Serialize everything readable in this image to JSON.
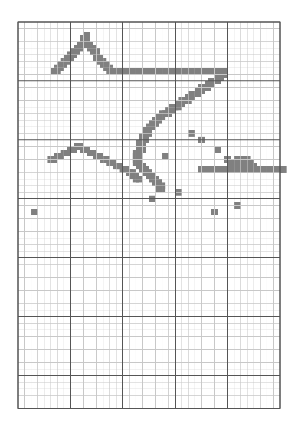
{
  "document": {
    "title": "Cross-Stitch Pattern Chart",
    "type": "pixel-grid-pattern",
    "subject": "Shooting stars and star"
  },
  "colors": {
    "background": "#ffffff",
    "fill": "#808080",
    "grid_minor": "#c8c8c8",
    "grid_major": "#555555",
    "grid_border": "#555555"
  },
  "grid": {
    "columns": 40,
    "rows": 59,
    "cell_size_px": 6.55,
    "origin_x_px": 18,
    "origin_y_px": 22,
    "major_every_columns": 8,
    "major_every_rows": 9,
    "minor_line_width_px": 0.5,
    "major_line_width_px": 1
  },
  "chart_data": {
    "type": "heatmap",
    "xlabel": "",
    "ylabel": "",
    "grid_on": true,
    "legend_position": "none",
    "categories": [],
    "values": [],
    "legend": [
      {
        "symbol": "filled-cell",
        "color": "#808080",
        "label": "Stitch"
      },
      {
        "symbol": "empty-cell",
        "color": "#ffffff",
        "label": "No stitch"
      }
    ],
    "stitch_cells": [
      [
        20,
        3
      ],
      [
        19,
        4
      ],
      [
        20,
        4
      ],
      [
        19,
        5
      ],
      [
        20,
        5
      ],
      [
        18,
        6
      ],
      [
        19,
        6
      ],
      [
        21,
        6
      ],
      [
        17,
        7
      ],
      [
        18,
        7
      ],
      [
        21,
        7
      ],
      [
        22,
        7
      ],
      [
        16,
        8
      ],
      [
        17,
        8
      ],
      [
        22,
        8
      ],
      [
        23,
        8
      ],
      [
        15,
        9
      ],
      [
        16,
        9
      ],
      [
        23,
        9
      ],
      [
        14,
        10
      ],
      [
        15,
        10
      ],
      [
        23,
        10
      ],
      [
        24,
        10
      ],
      [
        13,
        11
      ],
      [
        14,
        11
      ],
      [
        24,
        11
      ],
      [
        25,
        11
      ],
      [
        12,
        12
      ],
      [
        13,
        12
      ],
      [
        25,
        12
      ],
      [
        26,
        12
      ],
      [
        11,
        13
      ],
      [
        12,
        13
      ],
      [
        26,
        13
      ],
      [
        27,
        13
      ],
      [
        10,
        14
      ],
      [
        11,
        14
      ],
      [
        27,
        14
      ],
      [
        28,
        14
      ],
      [
        29,
        14
      ],
      [
        30,
        14
      ],
      [
        31,
        14
      ],
      [
        32,
        14
      ],
      [
        33,
        14
      ],
      [
        34,
        14
      ],
      [
        35,
        14
      ],
      [
        36,
        14
      ],
      [
        37,
        14
      ],
      [
        38,
        14
      ],
      [
        39,
        14
      ],
      [
        40,
        14
      ],
      [
        41,
        14
      ],
      [
        42,
        14
      ],
      [
        43,
        14
      ],
      [
        44,
        14
      ],
      [
        45,
        14
      ],
      [
        46,
        14
      ],
      [
        47,
        14
      ],
      [
        48,
        14
      ],
      [
        49,
        14
      ],
      [
        50,
        14
      ],
      [
        51,
        14
      ],
      [
        52,
        14
      ],
      [
        53,
        14
      ],
      [
        54,
        14
      ],
      [
        55,
        14
      ],
      [
        56,
        14
      ],
      [
        57,
        14
      ],
      [
        58,
        14
      ],
      [
        59,
        14
      ],
      [
        60,
        14
      ],
      [
        61,
        14
      ],
      [
        62,
        14
      ],
      [
        61,
        15
      ],
      [
        62,
        15
      ],
      [
        60,
        16
      ],
      [
        61,
        16
      ],
      [
        58,
        17
      ],
      [
        59,
        17
      ],
      [
        60,
        17
      ],
      [
        57,
        18
      ],
      [
        58,
        18
      ],
      [
        55,
        19
      ],
      [
        56,
        19
      ],
      [
        57,
        19
      ],
      [
        54,
        20
      ],
      [
        55,
        20
      ],
      [
        52,
        21
      ],
      [
        53,
        21
      ],
      [
        54,
        21
      ],
      [
        51,
        22
      ],
      [
        52,
        22
      ],
      [
        49,
        23
      ],
      [
        50,
        23
      ],
      [
        51,
        23
      ],
      [
        48,
        24
      ],
      [
        49,
        24
      ],
      [
        46,
        25
      ],
      [
        47,
        25
      ],
      [
        48,
        25
      ],
      [
        45,
        26
      ],
      [
        46,
        26
      ],
      [
        43,
        27
      ],
      [
        44,
        27
      ],
      [
        45,
        27
      ],
      [
        42,
        28
      ],
      [
        43,
        28
      ],
      [
        41,
        29
      ],
      [
        42,
        29
      ],
      [
        40,
        30
      ],
      [
        41,
        30
      ],
      [
        39,
        31
      ],
      [
        40,
        31
      ],
      [
        38,
        32
      ],
      [
        39,
        32
      ],
      [
        38,
        33
      ],
      [
        39,
        33
      ],
      [
        37,
        34
      ],
      [
        38,
        34
      ],
      [
        37,
        35
      ],
      [
        38,
        35
      ],
      [
        36,
        36
      ],
      [
        37,
        36
      ],
      [
        36,
        37
      ],
      [
        37,
        37
      ],
      [
        36,
        38
      ],
      [
        37,
        38
      ],
      [
        35,
        39
      ],
      [
        36,
        39
      ],
      [
        35,
        40
      ],
      [
        36,
        40
      ],
      [
        35,
        41
      ],
      [
        36,
        41
      ],
      [
        35,
        42
      ],
      [
        36,
        42
      ],
      [
        36,
        43
      ],
      [
        37,
        43
      ],
      [
        37,
        44
      ],
      [
        38,
        44
      ],
      [
        38,
        45
      ],
      [
        39,
        45
      ],
      [
        39,
        46
      ],
      [
        40,
        46
      ],
      [
        40,
        47
      ],
      [
        41,
        47
      ],
      [
        41,
        48
      ],
      [
        42,
        48
      ],
      [
        42,
        49
      ],
      [
        43,
        49
      ],
      [
        42,
        50
      ],
      [
        43,
        50
      ],
      [
        17,
        37
      ],
      [
        18,
        37
      ],
      [
        15,
        38
      ],
      [
        16,
        38
      ],
      [
        19,
        38
      ],
      [
        20,
        38
      ],
      [
        13,
        39
      ],
      [
        14,
        39
      ],
      [
        21,
        39
      ],
      [
        22,
        39
      ],
      [
        11,
        40
      ],
      [
        12,
        40
      ],
      [
        23,
        40
      ],
      [
        24,
        40
      ],
      [
        9,
        41
      ],
      [
        10,
        41
      ],
      [
        25,
        41
      ],
      [
        26,
        41
      ],
      [
        27,
        42
      ],
      [
        28,
        42
      ],
      [
        29,
        43
      ],
      [
        30,
        43
      ],
      [
        31,
        44
      ],
      [
        32,
        44
      ],
      [
        33,
        45
      ],
      [
        34,
        45
      ],
      [
        34,
        46
      ],
      [
        35,
        46
      ],
      [
        35,
        47
      ],
      [
        36,
        47
      ],
      [
        52,
        33
      ],
      [
        55,
        35
      ],
      [
        44,
        40
      ],
      [
        48,
        51
      ],
      [
        60,
        38
      ],
      [
        63,
        41
      ],
      [
        68,
        44
      ],
      [
        66,
        55
      ],
      [
        59,
        57
      ],
      [
        4,
        57
      ],
      [
        40,
        53
      ],
      [
        66,
        41
      ],
      [
        67,
        41
      ],
      [
        68,
        41
      ],
      [
        69,
        41
      ],
      [
        65,
        42
      ],
      [
        66,
        42
      ],
      [
        67,
        42
      ],
      [
        68,
        42
      ],
      [
        69,
        42
      ],
      [
        70,
        42
      ],
      [
        64,
        43
      ],
      [
        65,
        43
      ],
      [
        66,
        43
      ],
      [
        67,
        43
      ],
      [
        68,
        43
      ],
      [
        69,
        43
      ],
      [
        70,
        43
      ],
      [
        71,
        43
      ],
      [
        55,
        44
      ],
      [
        56,
        44
      ],
      [
        57,
        44
      ],
      [
        58,
        44
      ],
      [
        59,
        44
      ],
      [
        60,
        44
      ],
      [
        61,
        44
      ],
      [
        62,
        44
      ],
      [
        63,
        44
      ],
      [
        64,
        44
      ],
      [
        65,
        44
      ],
      [
        66,
        44
      ],
      [
        67,
        44
      ],
      [
        68,
        44
      ],
      [
        69,
        44
      ],
      [
        70,
        44
      ],
      [
        71,
        44
      ],
      [
        72,
        44
      ],
      [
        73,
        44
      ],
      [
        74,
        44
      ],
      [
        75,
        44
      ],
      [
        76,
        44
      ],
      [
        77,
        44
      ],
      [
        78,
        44
      ],
      [
        79,
        44
      ],
      [
        80,
        44
      ]
    ]
  },
  "pattern": {
    "shapes": [
      {
        "name": "comet-upper-left",
        "description": "Large inverted-V comet with peak near top-left"
      },
      {
        "name": "shooting-star-diagonal",
        "description": "Long horizontal bar with diagonal trailing edge"
      },
      {
        "name": "comet-lower-left",
        "description": "Second smaller inverted-V comet shape"
      },
      {
        "name": "five-point-star",
        "description": "Solid filled five-pointed star on the right"
      },
      {
        "name": "scattered-dots",
        "description": "Isolated single-cell sparkles"
      }
    ]
  }
}
